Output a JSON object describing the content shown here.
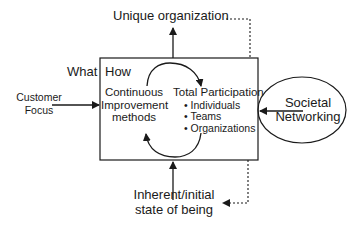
{
  "diagram": {
    "top_label": "Unique organization",
    "bottom_label": {
      "line1": "Inherent/initial",
      "line2": "state of being"
    },
    "left_input": {
      "line1": "Customer",
      "line2": "Focus"
    },
    "right_input": {
      "line1": "Societal",
      "line2": "Networking"
    },
    "box": {
      "what_label": "What",
      "how_label": "How",
      "left_node": {
        "line1": "Continuous",
        "line2": "Improvement",
        "line3": "methods"
      },
      "right_node": {
        "title": "Total Participation",
        "items": [
          "• Individuals",
          "• Teams",
          "• Organizations"
        ]
      }
    },
    "colors": {
      "line": "#1a1a1a",
      "background": "#ffffff"
    }
  }
}
